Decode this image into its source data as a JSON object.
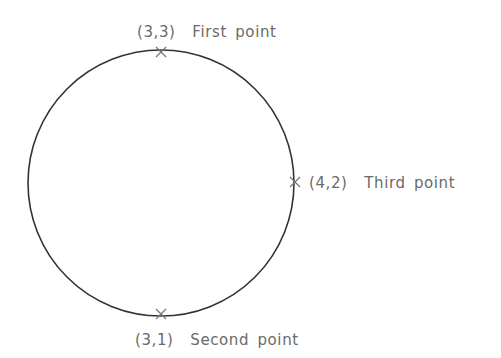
{
  "diagram": {
    "type": "circle-three-point",
    "colors": {
      "background": "#ffffff",
      "circle_stroke": "#333333",
      "marker_stroke": "#777777",
      "label_text": "#6a6a6a"
    },
    "circle": {
      "center_px": [
        161,
        183
      ],
      "radius_px": 133
    },
    "points": [
      {
        "coord": "(3,3)",
        "name": "First point",
        "px": [
          161,
          52
        ]
      },
      {
        "coord": "(3,1)",
        "name": "Second point",
        "px": [
          161,
          314
        ]
      },
      {
        "coord": "(4,2)",
        "name": "Third point",
        "px": [
          295,
          182
        ]
      }
    ],
    "labels": {
      "first": "(3,3)  First point",
      "second": "(3,1)  Second point",
      "third": "(4,2)  Third point"
    }
  }
}
